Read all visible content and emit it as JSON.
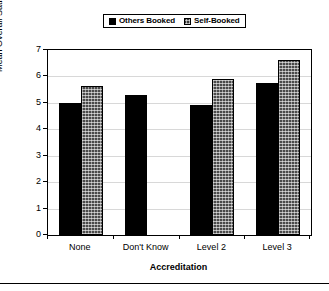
{
  "chart_data": {
    "type": "bar",
    "title": "",
    "xlabel": "Accreditation",
    "ylabel": "Mean Overall Satisfaction",
    "categories": [
      "None",
      "Don't Know",
      "Level 2",
      "Level 3"
    ],
    "series": [
      {
        "name": "Others Booked",
        "swatch": "solid-black",
        "color": "#000000",
        "values": [
          5.0,
          5.28,
          4.93,
          5.75
        ]
      },
      {
        "name": "Self-Booked",
        "swatch": "cross-hatch",
        "color": "#4a4a4a",
        "values": [
          5.65,
          null,
          5.9,
          6.63
        ]
      }
    ],
    "ylim": [
      0,
      7
    ],
    "yticks": [
      0,
      1,
      2,
      3,
      4,
      5,
      6,
      7
    ],
    "ytick_labels": [
      "0",
      "1",
      "2",
      "3",
      "4",
      "5",
      "6",
      "7"
    ],
    "grid": true,
    "grid_axis": "y",
    "legend_position": "top-center",
    "frame": true
  },
  "legend": {
    "entries": [
      {
        "label": "Others Booked",
        "swatch": "legend-swatch-others-booked"
      },
      {
        "label": "Self-Booked",
        "swatch": "legend-swatch-self-booked"
      }
    ]
  },
  "axes": {
    "y_axis_title": "Mean Overall Satisfaction",
    "x_axis_title": "Accreditation"
  }
}
